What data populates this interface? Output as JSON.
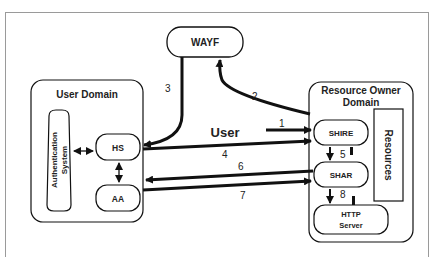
{
  "caption": "Figure: The Shibboleth architecture components and message flow",
  "diagram": {
    "wayf": {
      "label": "WAYF"
    },
    "user_domain": {
      "title": "User Domain",
      "auth_system": {
        "line1": "Authentication",
        "line2": "System"
      },
      "hs": {
        "label": "HS"
      },
      "aa": {
        "label": "AA"
      }
    },
    "resource_domain": {
      "title_line1": "Resource Owner",
      "title_line2": "Domain",
      "shire": {
        "label": "SHIRE"
      },
      "shar": {
        "label": "SHAR"
      },
      "http_server": {
        "line1": "HTTP",
        "line2": "Server"
      },
      "resources": {
        "label": "Resources"
      }
    },
    "user_label": "User",
    "arrows": [
      {
        "id": "1",
        "label": "1",
        "from": "User",
        "to": "SHIRE"
      },
      {
        "id": "2",
        "label": "2",
        "from": "SHIRE",
        "to": "WAYF"
      },
      {
        "id": "3",
        "label": "3",
        "from": "WAYF",
        "to": "HS"
      },
      {
        "id": "4",
        "label": "4",
        "from": "HS",
        "to": "SHIRE"
      },
      {
        "id": "5",
        "label": "5",
        "from": "SHIRE",
        "to": "SHAR"
      },
      {
        "id": "6",
        "label": "6",
        "from": "SHAR",
        "to": "AA"
      },
      {
        "id": "7",
        "label": "7",
        "from": "AA",
        "to": "SHAR"
      },
      {
        "id": "8",
        "label": "8",
        "from": "SHAR",
        "to": "HTTP Server"
      }
    ],
    "colors": {
      "stroke": "#111111",
      "frame": "#9a9a9a",
      "background": "#ffffff"
    }
  }
}
